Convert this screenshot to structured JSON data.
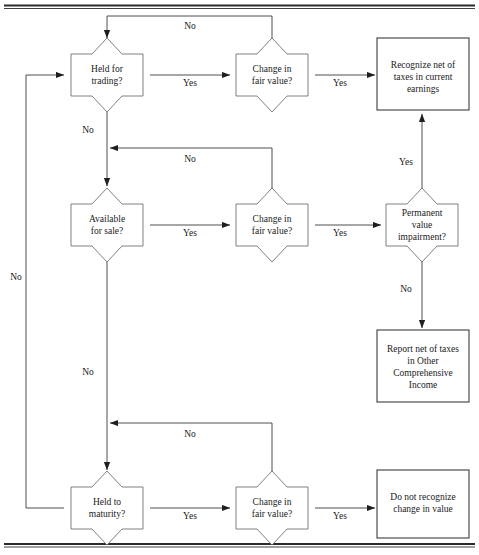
{
  "figure": {
    "type": "flowchart",
    "orientation": "left-to-right with loop-backs"
  },
  "colors": {
    "background": "#ffffff",
    "shape_stroke": "#5f5f5f",
    "box_stroke": "#3d3d3d",
    "connector": "#3a3a3a",
    "text": "#1a1a1a",
    "rule": "#2b2b2b"
  },
  "rules": {
    "top_rule": "horizontal double rule",
    "bottom_rule": "horizontal double rule"
  },
  "decisions": [
    {
      "id": "held-for-trading",
      "shape": "notched-diamond",
      "lines": [
        "Held for",
        "trading?"
      ],
      "cx": 107,
      "cy": 75
    },
    {
      "id": "change-fair-value-1",
      "shape": "notched-diamond",
      "lines": [
        "Change in",
        "fair value?"
      ],
      "cx": 272,
      "cy": 75
    },
    {
      "id": "available-for-sale",
      "shape": "notched-diamond",
      "lines": [
        "Available",
        "for sale?"
      ],
      "cx": 107,
      "cy": 225
    },
    {
      "id": "change-fair-value-2",
      "shape": "notched-diamond",
      "lines": [
        "Change in",
        "fair value?"
      ],
      "cx": 272,
      "cy": 225
    },
    {
      "id": "permanent-value-impairment",
      "shape": "notched-diamond",
      "lines": [
        "Permanent",
        "value",
        "impairment?"
      ],
      "cx": 422,
      "cy": 225
    },
    {
      "id": "held-to-maturity",
      "shape": "notched-diamond",
      "lines": [
        "Held to",
        "maturity?"
      ],
      "cx": 107,
      "cy": 508
    },
    {
      "id": "change-fair-value-3",
      "shape": "notched-diamond",
      "lines": [
        "Change in",
        "fair value?"
      ],
      "cx": 272,
      "cy": 508
    }
  ],
  "terminals": [
    {
      "id": "recognize-current-earnings",
      "shape": "rectangle",
      "lines": [
        "Recognize net of",
        "taxes in current",
        "earnings"
      ],
      "x": 377,
      "y": 38,
      "w": 92,
      "h": 72
    },
    {
      "id": "report-other-comprehensive-income",
      "shape": "rectangle",
      "lines": [
        "Report net of taxes",
        "in Other",
        "Comprehensive",
        "Income"
      ],
      "x": 377,
      "y": 330,
      "w": 92,
      "h": 72
    },
    {
      "id": "do-not-recognize",
      "shape": "rectangle",
      "lines": [
        "Do not recognize",
        "change in value"
      ],
      "x": 377,
      "y": 470,
      "w": 92,
      "h": 68
    }
  ],
  "edge_labels": [
    {
      "id": "hft-yes",
      "text": "Yes",
      "x": 190,
      "y": 86
    },
    {
      "id": "cfv1-yes",
      "text": "Yes",
      "x": 340,
      "y": 86
    },
    {
      "id": "cfv1-no",
      "text": "No",
      "x": 190,
      "y": 29
    },
    {
      "id": "hft-no",
      "text": "No",
      "x": 88,
      "y": 133
    },
    {
      "id": "cfv2-no-top",
      "text": "No",
      "x": 190,
      "y": 162
    },
    {
      "id": "afs-yes",
      "text": "Yes",
      "x": 190,
      "y": 236
    },
    {
      "id": "cfv2-yes",
      "text": "Yes",
      "x": 340,
      "y": 236
    },
    {
      "id": "pvi-yes",
      "text": "Yes",
      "x": 406,
      "y": 165
    },
    {
      "id": "pvi-no",
      "text": "No",
      "x": 406,
      "y": 292
    },
    {
      "id": "afs-no",
      "text": "No",
      "x": 88,
      "y": 375
    },
    {
      "id": "cfv3-no",
      "text": "No",
      "x": 190,
      "y": 437
    },
    {
      "id": "htm-yes",
      "text": "Yes",
      "x": 190,
      "y": 519
    },
    {
      "id": "cfv3-yes",
      "text": "Yes",
      "x": 340,
      "y": 519
    },
    {
      "id": "htm-no-left",
      "text": "No",
      "x": 16,
      "y": 280
    }
  ]
}
